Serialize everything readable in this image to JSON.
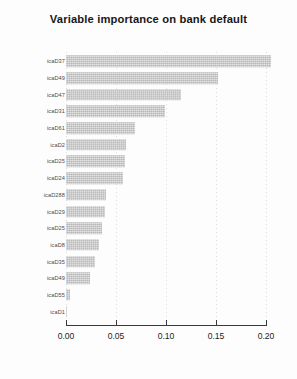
{
  "chart_data": {
    "type": "bar",
    "orientation": "horizontal",
    "title": "Variable importance on bank default",
    "xlabel": "",
    "ylabel": "",
    "xlim": [
      0.0,
      0.205
    ],
    "xticks": [
      0.0,
      0.05,
      0.1,
      0.15,
      0.2
    ],
    "xticklabels": [
      "0.00",
      "0.05",
      "0.10",
      "0.15",
      "0.20"
    ],
    "grid": "vertical-dotted",
    "legend": null,
    "bar_color": "#c9c9c9",
    "categories": [
      "icaD37",
      "icaD49",
      "icaD47",
      "icaD31",
      "icaD61",
      "icaD2",
      "icaD25",
      "icaD24",
      "icaD288",
      "icaD29",
      "icaD25",
      "icaD8",
      "icaD35",
      "icaD49",
      "icaD55",
      "icaD1"
    ],
    "values": [
      0.205,
      0.152,
      0.115,
      0.099,
      0.069,
      0.06,
      0.059,
      0.057,
      0.04,
      0.039,
      0.036,
      0.033,
      0.029,
      0.024,
      0.004,
      0.001
    ]
  }
}
